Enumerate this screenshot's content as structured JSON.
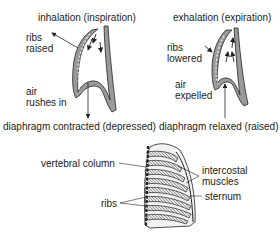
{
  "panels": {
    "inhalation": {
      "title": "inhalation (inspiration)",
      "ribs_label": [
        "ribs",
        "raised"
      ],
      "air_label": [
        "air",
        "rushes in"
      ],
      "diaphragm_label": "diaphragm contracted (depressed)"
    },
    "exhalation": {
      "title": "exhalation (expiration)",
      "ribs_label": [
        "ribs",
        "lowered"
      ],
      "air_label": [
        "air",
        "expelled"
      ],
      "diaphragm_label": "diaphragm relaxed (raised)"
    }
  },
  "ribcage": {
    "labels": {
      "vertebral_column": "vertebral column",
      "intercostal_muscles": [
        "intercostal",
        "muscles"
      ],
      "sternum": "sternum",
      "ribs": "ribs"
    }
  },
  "colors": {
    "line": "#222222",
    "shade": "#8a8a8a",
    "light": "#cfcfcf"
  }
}
